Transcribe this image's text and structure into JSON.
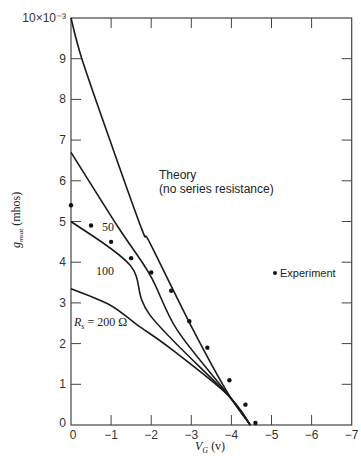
{
  "chart_data": {
    "type": "line",
    "title": "",
    "xlabel": "V_G (v)",
    "ylabel": "g_msat (mhos)",
    "xlim": [
      0,
      -7
    ],
    "ylim": [
      0,
      10
    ],
    "y_scale_label": "10×10⁻³",
    "x_ticks": [
      0,
      -1,
      -2,
      -3,
      -4,
      -5,
      -6,
      -7
    ],
    "x_tick_labels": [
      "0",
      "−1",
      "−2",
      "−3",
      "−4",
      "−5",
      "−6",
      "−7"
    ],
    "y_ticks": [
      0,
      1,
      2,
      3,
      4,
      5,
      6,
      7,
      8,
      9,
      10
    ],
    "y_tick_labels": [
      "0",
      "1",
      "2",
      "3",
      "4",
      "5",
      "6",
      "7",
      "8",
      "9",
      "10×10⁻³"
    ],
    "grid": false,
    "series": [
      {
        "name": "Theory (no series resistance)",
        "kind": "line",
        "x": [
          0,
          -0.27,
          -0.97,
          -1.77,
          -1.97,
          -3.05,
          -3.9,
          -4.47
        ],
        "y": [
          10,
          9,
          7,
          4.8,
          4.47,
          2.33,
          0.8,
          0
        ]
      },
      {
        "name": "50",
        "kind": "line",
        "x": [
          0,
          -1.17,
          -1.97,
          -2.65,
          -3.9,
          -4.47
        ],
        "y": [
          6.7,
          4.87,
          3.69,
          2.33,
          0.77,
          0
        ]
      },
      {
        "name": "100",
        "kind": "line",
        "x": [
          0,
          -1.47,
          -1.97,
          -3.9,
          -4.47
        ],
        "y": [
          5.0,
          3.93,
          2.7,
          0.75,
          0
        ]
      },
      {
        "name": "R_s = 200 Ω",
        "kind": "line",
        "x": [
          0,
          -0.97,
          -1.65,
          -2.47,
          -3.9,
          -4.47
        ],
        "y": [
          3.35,
          2.95,
          2.46,
          1.89,
          0.75,
          0
        ]
      },
      {
        "name": "Experiment",
        "kind": "scatter",
        "x": [
          0,
          -0.5,
          -1.0,
          -1.5,
          -2.0,
          -2.5,
          -2.95,
          -3.4,
          -3.95,
          -4.35,
          -4.6
        ],
        "y": [
          5.4,
          4.9,
          4.5,
          4.1,
          3.75,
          3.3,
          2.55,
          1.9,
          1.1,
          0.5,
          0.05
        ]
      }
    ],
    "annotations": [
      {
        "text": "Theory",
        "x": -2.18,
        "y": 6.2
      },
      {
        "text": "(no series resistance)",
        "x": -2.18,
        "y": 5.8
      },
      {
        "text": "50",
        "x": -0.7,
        "y": 4.7
      },
      {
        "text": "100",
        "x": -0.75,
        "y": 3.65
      },
      {
        "text": "R_s = 200 Ω",
        "x": -0.05,
        "y": 2.55
      },
      {
        "text": "• Experiment",
        "x": -5.0,
        "y": 3.7
      }
    ],
    "legend": {
      "position": "right-middle",
      "entries": [
        "Experiment"
      ]
    }
  },
  "labels": {
    "xlabel_main": "V",
    "xlabel_sub": "G",
    "xlabel_unit": " (v)",
    "ylabel_main": "g",
    "ylabel_sub": "msat",
    "ylabel_unit": " (mhos)",
    "theory_line1": "Theory",
    "theory_line2": "(no series resistance)",
    "r50": "50",
    "r100": "100",
    "r200_main": "R",
    "r200_sub": "s",
    "r200_rest": " = 200 Ω",
    "legend_experiment": "Experiment",
    "origin_y": "0"
  }
}
